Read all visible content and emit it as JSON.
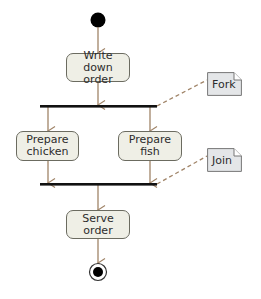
{
  "diagram": {
    "type": "UML activity diagram",
    "colors": {
      "flow_arrow": "#a08468",
      "note_connector": "#a08468",
      "activity_fill": "#efefe6",
      "activity_border": "#6b6b60",
      "note_fill": "#e4e6e8",
      "bar": "#111111"
    },
    "nodes": {
      "start": {
        "kind": "initial-node"
      },
      "write_order": {
        "kind": "action",
        "line1": "Write down",
        "line2": "order"
      },
      "fork": {
        "kind": "fork-bar"
      },
      "prepare_chicken": {
        "kind": "action",
        "line1": "Prepare",
        "line2": "chicken"
      },
      "prepare_fish": {
        "kind": "action",
        "line1": "Prepare",
        "line2": "fish"
      },
      "join": {
        "kind": "join-bar"
      },
      "serve_order": {
        "kind": "action",
        "line1": "Serve",
        "line2": "order"
      },
      "end": {
        "kind": "final-node"
      }
    },
    "notes": {
      "fork_note": {
        "label": "Fork",
        "attached_to": "fork"
      },
      "join_note": {
        "label": "Join",
        "attached_to": "join"
      }
    },
    "edges": [
      {
        "from": "start",
        "to": "write_order"
      },
      {
        "from": "write_order",
        "to": "fork"
      },
      {
        "from": "fork",
        "to": "prepare_chicken"
      },
      {
        "from": "fork",
        "to": "prepare_fish"
      },
      {
        "from": "prepare_chicken",
        "to": "join"
      },
      {
        "from": "prepare_fish",
        "to": "join"
      },
      {
        "from": "join",
        "to": "serve_order"
      },
      {
        "from": "serve_order",
        "to": "end"
      }
    ]
  }
}
